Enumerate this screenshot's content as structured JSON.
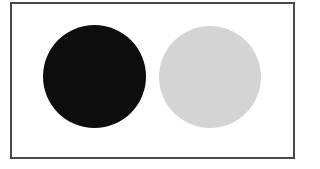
{
  "figure": {
    "frame": {
      "left": 10,
      "top": 2,
      "width": 281,
      "height": 153,
      "border_color": "#4a4a4a"
    },
    "shapes": [
      {
        "type": "circle",
        "name": "black-circle",
        "fill": "#0d0d0d",
        "cx": 94.5,
        "cy": 76.5,
        "diameter": 103
      },
      {
        "type": "circle",
        "name": "gray-circle",
        "fill": "#d4d4d4",
        "cx": 210,
        "cy": 76.5,
        "diameter": 102
      }
    ]
  }
}
